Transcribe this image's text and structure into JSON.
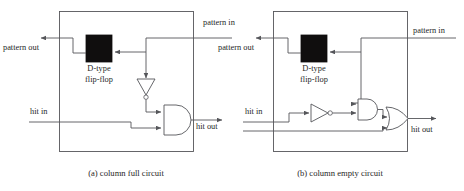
{
  "figure": {
    "type": "logic-circuit-diagram",
    "panel_count": 2,
    "line_color": "#55565a",
    "block_fill": "#100e0e",
    "background": "#ffffff"
  },
  "panel_a": {
    "caption": "(a) column full circuit",
    "block": {
      "line1": "D-type",
      "line2": "flip-flop",
      "name": "d-type-flip-flop"
    },
    "ports": {
      "pattern_in": "pattern in",
      "pattern_out": "pattern out",
      "hit_in": "hit in",
      "hit_out": "hit out"
    },
    "gates": [
      {
        "name": "inverter",
        "type": "NOT",
        "inputs": 1
      },
      {
        "name": "and-gate",
        "type": "AND",
        "inputs": 2
      }
    ]
  },
  "panel_b": {
    "caption": "(b) column empty circuit",
    "block": {
      "line1": "D-type",
      "line2": "flip-flop",
      "name": "d-type-flip-flop"
    },
    "ports": {
      "pattern_in": "pattern in",
      "pattern_out": "pattern out",
      "hit_in": "hit in",
      "hit_out": "hit out"
    },
    "gates": [
      {
        "name": "inverter",
        "type": "NOT",
        "inputs": 1
      },
      {
        "name": "and-gate",
        "type": "AND",
        "inputs": 2
      },
      {
        "name": "or-gate",
        "type": "OR",
        "inputs": 2
      }
    ]
  }
}
